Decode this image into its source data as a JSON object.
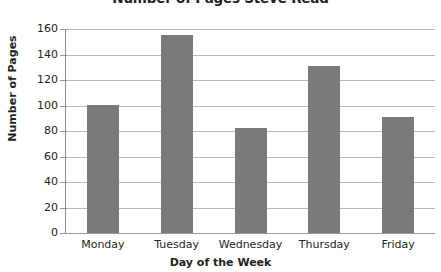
{
  "chart_data": {
    "type": "bar",
    "title": "Number of Pages Steve Read",
    "xlabel": "Day of the Week",
    "ylabel": "Number of Pages",
    "categories": [
      "Monday",
      "Tuesday",
      "Wednesday",
      "Thursday",
      "Friday"
    ],
    "values": [
      100,
      155,
      82,
      131,
      91
    ],
    "series": [
      {
        "name": "Pages read",
        "values": [
          100,
          155,
          82,
          131,
          91
        ]
      }
    ],
    "ylim": [
      0,
      160
    ],
    "ytick_values": [
      0,
      20,
      40,
      60,
      80,
      100,
      120,
      140,
      160
    ],
    "ytick_labels": [
      "0",
      "20",
      "40",
      "60",
      "80",
      "100",
      "120",
      "140",
      "160"
    ],
    "grid": true,
    "grid_axis": "y",
    "legend": false,
    "legend_position": "none",
    "bar_color": "#7a7a7a",
    "gridline_color": "#b9b9b9",
    "axis_color": "#8d8d8d",
    "text_color": "#231f20",
    "background_color": "#ffffff"
  }
}
